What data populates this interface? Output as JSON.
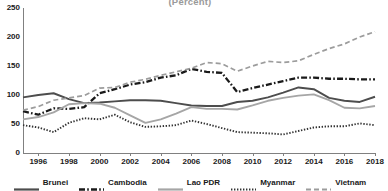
{
  "chart_data": {
    "type": "line",
    "title": "(Percent)",
    "xlabel": "",
    "ylabel": "",
    "xlim": [
      1995,
      2018
    ],
    "ylim": [
      0,
      250
    ],
    "ytick_values": [
      0,
      50,
      100,
      150,
      200,
      250
    ],
    "xtick_values": [
      1996,
      1998,
      2000,
      2002,
      2004,
      2006,
      2008,
      2010,
      2012,
      2014,
      2016,
      2018
    ],
    "grid": false,
    "legend_position": "bottom",
    "x": [
      1995,
      1996,
      1997,
      1998,
      1999,
      2000,
      2001,
      2002,
      2003,
      2004,
      2005,
      2006,
      2007,
      2008,
      2009,
      2010,
      2011,
      2012,
      2013,
      2014,
      2015,
      2016,
      2017,
      2018
    ],
    "series": [
      {
        "name": "Brunei",
        "color": "#4d4d4d",
        "style": "solid",
        "values": [
          96,
          100,
          103,
          93,
          86,
          87,
          89,
          91,
          91,
          90,
          86,
          82,
          81,
          81,
          88,
          90,
          96,
          104,
          113,
          110,
          95,
          90,
          88,
          97
        ]
      },
      {
        "name": "Cambodia",
        "color": "#1a1a1a",
        "style": "dash-dot",
        "values": [
          72,
          66,
          77,
          76,
          79,
          103,
          110,
          118,
          122,
          130,
          134,
          145,
          140,
          138,
          105,
          112,
          118,
          124,
          130,
          130,
          128,
          128,
          127,
          127
        ]
      },
      {
        "name": "Lao PDR",
        "color": "#a6a6a6",
        "style": "solid",
        "values": [
          58,
          62,
          70,
          84,
          86,
          85,
          78,
          65,
          52,
          58,
          68,
          79,
          76,
          76,
          75,
          82,
          90,
          95,
          99,
          101,
          91,
          78,
          77,
          81
        ]
      },
      {
        "name": "Myanmar",
        "color": "#333333",
        "style": "dotted",
        "values": [
          48,
          44,
          36,
          52,
          60,
          58,
          66,
          53,
          45,
          46,
          48,
          56,
          50,
          43,
          36,
          35,
          34,
          32,
          38,
          44,
          46,
          46,
          51,
          48
        ]
      },
      {
        "name": "Vietnam",
        "color": "#9c9c9c",
        "style": "dashed",
        "values": [
          74,
          80,
          91,
          95,
          99,
          112,
          113,
          122,
          127,
          134,
          140,
          146,
          156,
          154,
          141,
          150,
          158,
          156,
          159,
          170,
          180,
          188,
          200,
          209
        ]
      }
    ]
  }
}
